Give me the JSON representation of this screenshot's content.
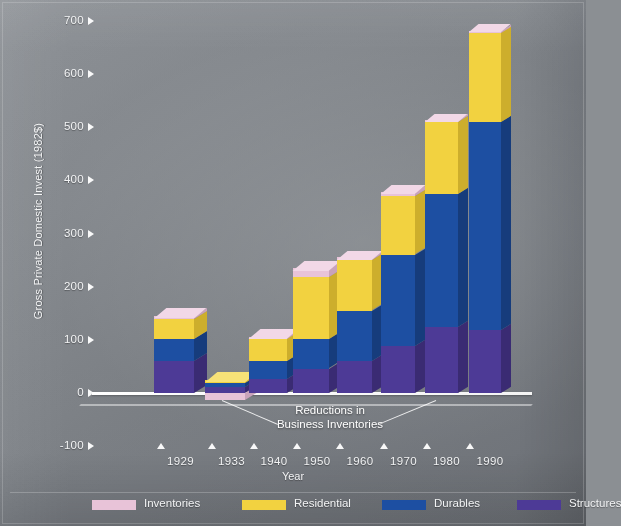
{
  "chart_data": {
    "type": "bar",
    "subtype": "stacked-3d-column",
    "title": "",
    "xlabel": "Year",
    "ylabel": "Gross Private Domestic Invest (1982$)",
    "categories": [
      "1929",
      "1933",
      "1940",
      "1950",
      "1960",
      "1970",
      "1980",
      "1990"
    ],
    "ylim": [
      -100,
      700
    ],
    "yticks": [
      -100,
      0,
      100,
      200,
      300,
      400,
      500,
      600,
      700
    ],
    "grid": false,
    "legend_position": "bottom",
    "stack_order_bottom_to_top": [
      "Structures",
      "Durables",
      "Residential",
      "Inventories"
    ],
    "series": [
      {
        "name": "Structures",
        "color": "#4d3a96",
        "values": [
          61,
          11,
          26,
          46,
          60,
          88,
          125,
          118
        ]
      },
      {
        "name": "Durables",
        "color": "#1d4fa2",
        "values": [
          41,
          8,
          34,
          55,
          95,
          172,
          250,
          392
        ]
      },
      {
        "name": "Residential",
        "color": "#f2d240",
        "values": [
          37,
          5,
          44,
          117,
          95,
          110,
          135,
          170
        ]
      },
      {
        "name": "Inventories",
        "color": "#e8c3d8",
        "values": [
          5,
          -13,
          2,
          17,
          5,
          8,
          3,
          2
        ]
      }
    ],
    "totals": [
      139,
      22,
      105,
      235,
      250,
      370,
      510,
      680
    ],
    "annotations": [
      {
        "text": "Reductions in Business Inventories",
        "points_to": [
          "1933",
          "1980"
        ]
      }
    ]
  },
  "axis": {
    "y_ticks": [
      {
        "label": "700",
        "value": 700
      },
      {
        "label": "600",
        "value": 600
      },
      {
        "label": "500",
        "value": 500
      },
      {
        "label": "400",
        "value": 400
      },
      {
        "label": "300",
        "value": 300
      },
      {
        "label": "200",
        "value": 200
      },
      {
        "label": "100",
        "value": 100
      },
      {
        "label": "0",
        "value": 0
      },
      {
        "label": "-100",
        "value": -100
      }
    ],
    "y_title": "Gross Private Domestic Invest (1982$)",
    "x_title": "Year",
    "x_ticks": [
      "1929",
      "1933",
      "1940",
      "1950",
      "1960",
      "1970",
      "1980",
      "1990"
    ]
  },
  "annotation": {
    "line1": "Reductions in",
    "line2": "Business Inventories"
  },
  "legend": {
    "items": [
      {
        "label": "Inventories",
        "color": "#e8c3d8"
      },
      {
        "label": "Residential",
        "color": "#f2d240"
      },
      {
        "label": "Durables",
        "color": "#1d4fa2"
      },
      {
        "label": "Structures",
        "color": "#4d3a96"
      }
    ]
  },
  "colors": {
    "inventories": "#e8c3d8",
    "residential": "#f2d240",
    "durables": "#1d4fa2",
    "structures": "#4d3a96",
    "axis": "#ffffff",
    "background": "#7d8186"
  }
}
